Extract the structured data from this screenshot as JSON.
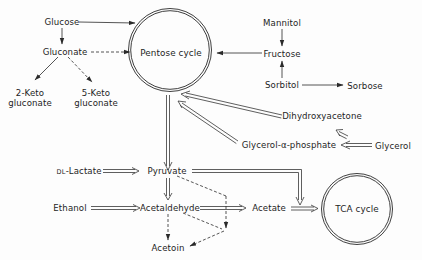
{
  "diagram": {
    "type": "metabolic-pathway",
    "colors": {
      "line": "#2a2a2a",
      "background": "#fdfdfd",
      "text": "#1e1e1e"
    },
    "cycles": [
      {
        "id": "pentose",
        "label": "Pentose cycle"
      },
      {
        "id": "tca",
        "label": "TCA cycle"
      }
    ],
    "nodes": {
      "glucose": "Glucose",
      "gluconate": "Gluconate",
      "keto2_line1": "2-Keto",
      "keto2_line2": "gluconate",
      "keto5_line1": "5-Keto",
      "keto5_line2": "gluconate",
      "mannitol": "Mannitol",
      "fructose": "Fructose",
      "sorbitol": "Sorbitol",
      "sorbose": "Sorbose",
      "dihydroxyacetone": "Dihydroxyacetone",
      "glycerol_phosphate": "Glycerol-α-phosphate",
      "glycerol": "Glycerol",
      "lactate_prefix": "DL",
      "lactate": "-Lactate",
      "pyruvate": "Pyruvate",
      "ethanol": "Ethanol",
      "acetaldehyde": "Acetaldehyde",
      "acetate": "Acetate",
      "acetoin": "Acetoin"
    },
    "edges": [
      {
        "from": "Glucose",
        "to": "Pentose cycle",
        "style": "single"
      },
      {
        "from": "Glucose",
        "to": "Gluconate",
        "style": "single"
      },
      {
        "from": "Gluconate",
        "to": "Pentose cycle",
        "style": "dashed"
      },
      {
        "from": "Gluconate",
        "to": "2-Keto gluconate",
        "style": "single"
      },
      {
        "from": "Gluconate",
        "to": "5-Keto gluconate",
        "style": "dashed"
      },
      {
        "from": "Mannitol",
        "to": "Fructose",
        "style": "single"
      },
      {
        "from": "Sorbitol",
        "to": "Fructose",
        "style": "single"
      },
      {
        "from": "Sorbitol",
        "to": "Sorbose",
        "style": "single"
      },
      {
        "from": "Fructose",
        "to": "Pentose cycle",
        "style": "single"
      },
      {
        "from": "Dihydroxyacetone",
        "to": "Pentose cycle",
        "style": "double"
      },
      {
        "from": "Glycerol-α-phosphate",
        "to": "Pentose cycle",
        "style": "double"
      },
      {
        "from": "Glycerol",
        "to": "Dihydroxyacetone",
        "style": "double"
      },
      {
        "from": "Glycerol",
        "to": "Glycerol-α-phosphate",
        "style": "double"
      },
      {
        "from": "Pentose cycle",
        "to": "Pyruvate",
        "style": "double"
      },
      {
        "from": "DL-Lactate",
        "to": "Pyruvate",
        "style": "double"
      },
      {
        "from": "Pyruvate",
        "to": "Acetaldehyde",
        "style": "double"
      },
      {
        "from": "Pyruvate",
        "to": "TCA cycle",
        "style": "double"
      },
      {
        "from": "Pyruvate",
        "to": "Acetoin",
        "style": "dashed"
      },
      {
        "from": "Ethanol",
        "to": "Acetaldehyde",
        "style": "double"
      },
      {
        "from": "Acetaldehyde",
        "to": "Acetate",
        "style": "double"
      },
      {
        "from": "Acetaldehyde",
        "to": "Acetoin",
        "style": "dashed"
      },
      {
        "from": "Acetate",
        "to": "TCA cycle",
        "style": "double"
      }
    ]
  }
}
